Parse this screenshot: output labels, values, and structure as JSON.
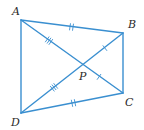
{
  "diagram": {
    "type": "quadrilateral-with-diagonals",
    "line_color": "#3a8fd0",
    "label_color": "#2a2a2a",
    "vertices": [
      {
        "id": "A",
        "label": "A",
        "x": 21,
        "y": 20,
        "label_x": 12,
        "label_y": 15
      },
      {
        "id": "B",
        "label": "B",
        "x": 123,
        "y": 33,
        "label_x": 128,
        "label_y": 28
      },
      {
        "id": "C",
        "label": "C",
        "x": 123,
        "y": 93,
        "label_x": 125,
        "label_y": 106
      },
      {
        "id": "D",
        "label": "D",
        "x": 21,
        "y": 113,
        "label_x": 11,
        "label_y": 126
      }
    ],
    "intersection": {
      "id": "P",
      "label": "P",
      "x": 82,
      "y": 64,
      "label_x": 79,
      "label_y": 80
    },
    "segments": [
      {
        "from": "A",
        "to": "B",
        "ticks": 2
      },
      {
        "from": "B",
        "to": "C",
        "ticks": 0
      },
      {
        "from": "C",
        "to": "D",
        "ticks": 2
      },
      {
        "from": "D",
        "to": "A",
        "ticks": 0
      },
      {
        "from": "A",
        "to": "P",
        "ticks": 3
      },
      {
        "from": "P",
        "to": "C",
        "ticks": 1
      },
      {
        "from": "D",
        "to": "P",
        "ticks": 3
      },
      {
        "from": "P",
        "to": "B",
        "ticks": 1
      }
    ]
  }
}
